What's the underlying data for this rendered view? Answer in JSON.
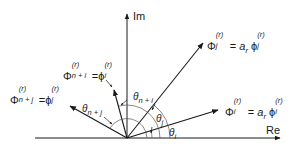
{
  "diagram": {
    "type": "complex-plane-vector-diagram",
    "axes": {
      "real_label": "Re",
      "imag_label": "Im"
    },
    "origin": {
      "x": 127,
      "y": 138
    },
    "vectors": [
      {
        "id": "phi_i",
        "label_lhs": "Φ",
        "lhs_sup": "(r)",
        "lhs_sub": "i",
        "eq": "=",
        "coef": "a",
        "coef_sub": "r",
        "rhs": "ϕ",
        "rhs_sup": "(r)",
        "rhs_sub": "i",
        "angle_label": "θ",
        "angle_sub": "i"
      },
      {
        "id": "phi_j",
        "label_lhs": "Φ",
        "lhs_sup": "(r)",
        "lhs_sub": "j",
        "eq": "=",
        "coef": "a",
        "coef_sub": "r",
        "rhs": "ϕ",
        "rhs_sup": "(r)",
        "rhs_sub": "j",
        "angle_label": "θ",
        "angle_sub": "j"
      },
      {
        "id": "phi_n_plus_i",
        "label_lhs": "Φ",
        "lhs_sup": "(r)",
        "lhs_sub": "n + i",
        "eq": "=",
        "rhs": "ϕ",
        "rhs_sup": "(r)",
        "rhs_sub": "i",
        "angle_label": "θ",
        "angle_sub": "n + i"
      },
      {
        "id": "phi_n_plus_j",
        "label_lhs": "Φ",
        "lhs_sup": "(r)",
        "lhs_sub": "n + j",
        "eq": "=",
        "rhs": "ϕ",
        "rhs_sup": "(r)",
        "rhs_sub": "j",
        "angle_label": "θ",
        "angle_sub": "n + j"
      }
    ]
  }
}
